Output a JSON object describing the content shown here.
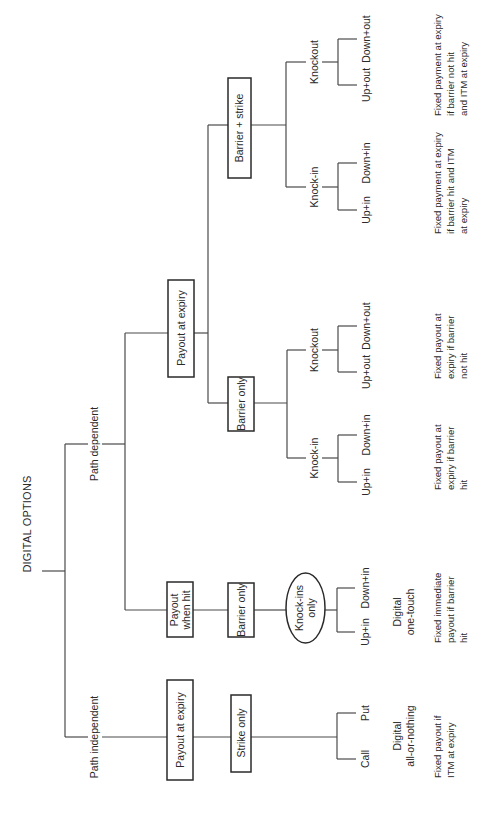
{
  "title": "DIGITAL OPTIONS",
  "branches": {
    "path_dependent": "Path dependent",
    "path_independent": "Path independent"
  },
  "path_independent": {
    "payout": "Payout at expiry",
    "type": "Strike only",
    "leaves": [
      "Call",
      "Put"
    ],
    "name_lines": [
      "Digital",
      "all-or-nothing"
    ],
    "desc_lines": [
      "Fixed payout if",
      "ITM at expiry"
    ]
  },
  "payout_when_hit": {
    "payout_lines": [
      "Payout",
      "when hit"
    ],
    "type": "Barrier only",
    "oval_lines": [
      "Knock-ins",
      "only"
    ],
    "leaves": [
      "Up+in",
      "Down+in"
    ],
    "name_lines": [
      "Digital",
      "one-touch"
    ],
    "desc_lines": [
      "Fixed immediate",
      "payout if barrier",
      "hit"
    ]
  },
  "payout_at_expiry_dep": {
    "payout": "Payout at expiry",
    "barrier_only": {
      "label": "Barrier only",
      "knock_in": {
        "label": "Knock-in",
        "leaves": [
          "Up+in",
          "Down+in"
        ],
        "desc_lines": [
          "Fixed payout at",
          "expiry if barrier",
          "hit"
        ]
      },
      "knockout": {
        "label": "Knockout",
        "leaves": [
          "Up+out",
          "Down+out"
        ],
        "desc_lines": [
          "Fixed payout at",
          "expiry if barrier",
          "not hit"
        ]
      }
    },
    "barrier_strike": {
      "label": "Barrier + strike",
      "knock_in": {
        "label": "Knock-in",
        "leaves": [
          "Up+in",
          "Down+in"
        ],
        "desc_lines": [
          "Fixed payment at expiry",
          "if barrier hit and ITM",
          "at expiry"
        ]
      },
      "knockout": {
        "label": "Knockout",
        "leaves": [
          "Up+out",
          "Down+out"
        ],
        "desc_lines": [
          "Fixed payment at expiry",
          "if barrier not hit",
          "and ITM at expiry"
        ]
      }
    }
  }
}
